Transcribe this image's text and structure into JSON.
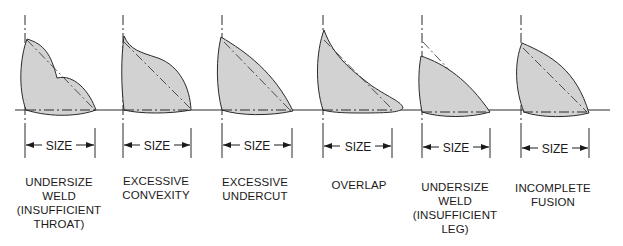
{
  "figure": {
    "colors": {
      "fill": "#d2d2d2",
      "stroke": "#2a2a2a",
      "background": "#ffffff"
    },
    "dimension_label": "SIZE",
    "panels": [
      {
        "id": "undersize-throat",
        "label": "UNDERSIZE\nWELD\n(INSUFFICIENT\nTHROAT)",
        "size_label": "SIZE"
      },
      {
        "id": "excessive-convexity",
        "label": "EXCESSIVE\nCONVEXITY",
        "size_label": "SIZE"
      },
      {
        "id": "excessive-undercut",
        "label": "EXCESSIVE\nUNDERCUT",
        "size_label": "SIZE"
      },
      {
        "id": "overlap",
        "label": "OVERLAP",
        "size_label": "SIZE"
      },
      {
        "id": "undersize-leg",
        "label": "UNDERSIZE\nWELD\n(INSUFFICIENT\nLEG)",
        "size_label": "SIZE"
      },
      {
        "id": "incomplete-fusion",
        "label": "INCOMPLETE\nFUSION",
        "size_label": "SIZE"
      }
    ]
  }
}
